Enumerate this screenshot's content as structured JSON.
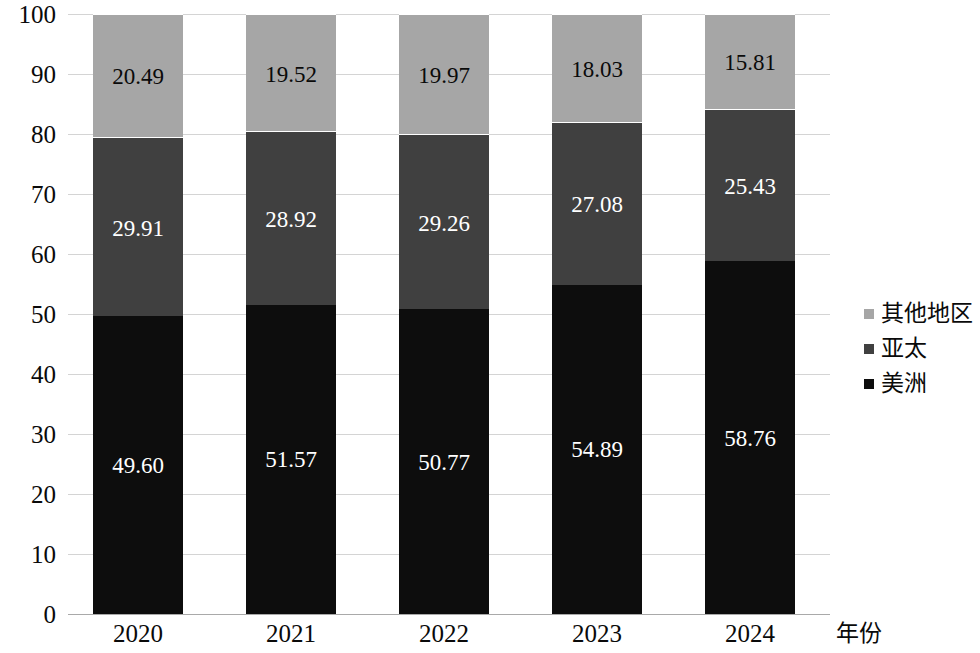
{
  "chart_data": {
    "type": "bar",
    "stacked": true,
    "title": "",
    "xlabel": "年份",
    "ylabel": "",
    "categories": [
      "2020",
      "2021",
      "2022",
      "2023",
      "2024"
    ],
    "ylim": [
      0,
      100
    ],
    "yticks": [
      0,
      10,
      20,
      30,
      40,
      50,
      60,
      70,
      80,
      90,
      100
    ],
    "ytick_labels": [
      "0",
      "10",
      "20",
      "30",
      "40",
      "50",
      "60",
      "70",
      "80",
      "90",
      "100"
    ],
    "grid": true,
    "legend_position": "right",
    "series": [
      {
        "name": "美洲",
        "color": "#0d0d0d",
        "label_color": "#ffffff",
        "values": [
          49.6,
          51.57,
          50.77,
          54.89,
          58.76
        ],
        "labels": [
          "49.60",
          "51.57",
          "50.77",
          "54.89",
          "58.76"
        ]
      },
      {
        "name": "亚太",
        "color": "#404040",
        "label_color": "#ffffff",
        "values": [
          29.91,
          28.92,
          29.26,
          27.08,
          25.43
        ],
        "labels": [
          "29.91",
          "28.92",
          "29.26",
          "27.08",
          "25.43"
        ]
      },
      {
        "name": "其他地区",
        "color": "#a6a6a6",
        "label_color": "#0a0a0a",
        "values": [
          20.49,
          19.52,
          19.97,
          18.03,
          15.81
        ],
        "labels": [
          "20.49",
          "19.52",
          "19.97",
          "18.03",
          "15.81"
        ]
      }
    ]
  },
  "legend": {
    "items": [
      {
        "label": "其他地区",
        "color": "#a6a6a6"
      },
      {
        "label": "亚太",
        "color": "#404040"
      },
      {
        "label": "美洲",
        "color": "#0d0d0d"
      }
    ]
  },
  "axis": {
    "x_title": "年份"
  }
}
